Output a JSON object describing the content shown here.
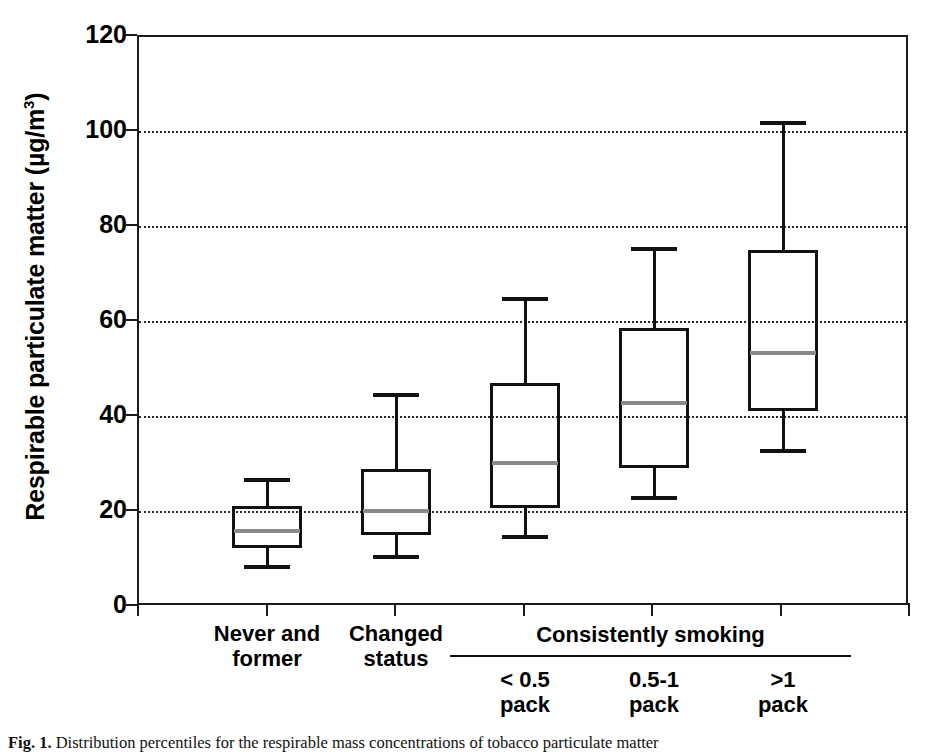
{
  "chart_data": {
    "type": "box",
    "title": "",
    "xlabel": "",
    "ylabel": "Respirable particulate matter (µg/m³)",
    "ylabel_main": "Respirable particulate matter (µg/m",
    "ylabel_sup": "3",
    "ylabel_tail": ")",
    "ylim": [
      0,
      120
    ],
    "ytick_labels": [
      "120",
      "100",
      "80",
      "60",
      "40",
      "20",
      "0"
    ],
    "ytick_values": [
      120,
      100,
      80,
      60,
      40,
      20,
      0
    ],
    "grid": "horizontal-dotted",
    "gridline_values": [
      100,
      80,
      60,
      40,
      20
    ],
    "legend": "none",
    "categories": [
      "Never and former",
      "Changed status",
      "< 0.5 pack",
      "0.5-1 pack",
      ">1 pack"
    ],
    "category_labels": [
      {
        "line1": "Never and",
        "line2": "former"
      },
      {
        "line1": "Changed",
        "line2": "status"
      },
      {
        "line1": "< 0.5",
        "line2": "pack"
      },
      {
        "line1": "0.5-1",
        "line2": "pack"
      },
      {
        "line1": ">1",
        "line2": "pack"
      }
    ],
    "group_bracket": {
      "label": "Consistently smoking",
      "covers": [
        "< 0.5 pack",
        "0.5-1 pack",
        ">1 pack"
      ]
    },
    "boxes": [
      {
        "category": "Never and former",
        "lower_whisker": 8.4,
        "q1": 11.9,
        "median": 16.1,
        "q3": 20.9,
        "upper_whisker": 26.8
      },
      {
        "category": "Changed status",
        "lower_whisker": 10.5,
        "q1": 14.7,
        "median": 20.3,
        "q3": 28.7,
        "upper_whisker": 44.6
      },
      {
        "category": "< 0.5 pack",
        "lower_whisker": 14.7,
        "q1": 20.5,
        "median": 30.4,
        "q3": 46.7,
        "upper_whisker": 64.9
      },
      {
        "category": "0.5-1 pack",
        "lower_whisker": 23.0,
        "q1": 28.9,
        "median": 42.9,
        "q3": 58.4,
        "upper_whisker": 75.4
      },
      {
        "category": ">1 pack",
        "lower_whisker": 32.9,
        "q1": 40.8,
        "median": 53.4,
        "q3": 74.8,
        "upper_whisker": 101.8
      }
    ],
    "colors": {
      "axis": "#1a1a1a",
      "box_edge": "#111111",
      "median": "#8a8a8a",
      "grid": "#2b2b2b",
      "background": "#ffffff"
    }
  },
  "caption": {
    "prefix": "Fig. 1.",
    "text": "Distribution percentiles for the respirable mass concentrations of tobacco particulate matter"
  }
}
